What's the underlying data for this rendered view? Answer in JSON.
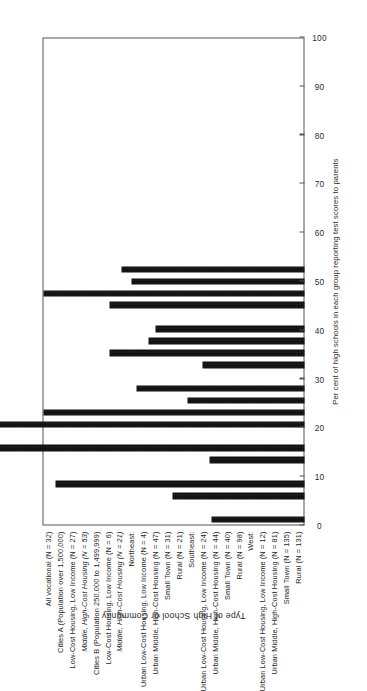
{
  "chart_data": {
    "type": "bar",
    "orientation": "horizontal",
    "title": "",
    "xlabel": "Per cent of high schools in each group reporting test scores to parents",
    "ylabel": "Type of High School or Community",
    "xlim": [
      0,
      100
    ],
    "xticks": [
      0,
      10,
      20,
      30,
      40,
      50,
      60,
      70,
      80,
      90,
      100
    ],
    "xtick_labels": [
      "0",
      "10",
      "20",
      "30",
      "40",
      "50",
      "60",
      "70",
      "80",
      "90",
      "100"
    ],
    "grid": false,
    "legend": null,
    "bar_color": "#111111",
    "categories": [
      "All vocational (N = 32)",
      "Cities A (Population over 1,500,000)",
      "Low-Cost Housing, Low Income (N = 27)",
      "Middle, High-Cost Housing (N = 53)",
      "Cities B (Population 250,000 to 1,499,999)",
      "Low-Cost Housing, Low Income (N = 6)",
      "Middle, High-Cost Housing (N = 21)",
      "Northeast:",
      "Urban Low-Cost Housing, Low Income (N = 4)",
      "Urban Middle, High-Cost Housing (N = 47)",
      "Small Town (N = 31)",
      "Rural (N = 21)",
      "Southeast:",
      "Urban Low-Cost Housing, Low Income (N = 24)",
      "Urban Middle, High-Cost Housing (N = 44)",
      "Small Town (N = 40)",
      "Rural (N = 98)",
      "West:",
      "Urban Low-Cost Housing, Low Income (N = 12)",
      "Urban Middle, High-Cost Housing (N = 81)",
      "Small Town (N = 135)",
      "Rural (N = 131)"
    ],
    "values": [
      19,
      null,
      27,
      51,
      null,
      19.5,
      74.5,
      null,
      74.5,
      53.5,
      24,
      34.5,
      null,
      21,
      40,
      32,
      30.5,
      null,
      40,
      53.5,
      35.5,
      37.5
    ],
    "bars": [
      {
        "label": "All vocational (N = 32)",
        "value": 19,
        "kind": "bar",
        "style": "plain"
      },
      {
        "label": "Cities A (Population over 1,500,000)",
        "value": null,
        "kind": "group-heading",
        "style": "plain"
      },
      {
        "label": "Low-Cost Housing, Low Income (N = 27)",
        "value": 27,
        "kind": "bar",
        "style": "plain"
      },
      {
        "label": "Middle, High-Cost Housing (N = 53)",
        "value": 51,
        "kind": "bar",
        "style": "italic"
      },
      {
        "label": "Cities B (Population 250,000 to 1,499,999)",
        "value": null,
        "kind": "group-heading",
        "style": "plain"
      },
      {
        "label": "Low-Cost Housing, Low Income (N = 6)",
        "value": 19.5,
        "kind": "bar",
        "style": "plain"
      },
      {
        "label": "Middle, High-Cost Housing (N = 21)",
        "value": 74.5,
        "kind": "bar",
        "style": "italic"
      },
      {
        "label": "Northeast:",
        "value": null,
        "kind": "group-heading",
        "style": "plain"
      },
      {
        "label": "Urban Low-Cost Housing, Low Income (N = 4)",
        "value": 74.5,
        "kind": "bar",
        "style": "plain"
      },
      {
        "label": "Urban Middle, High-Cost Housing (N = 47)",
        "value": 53.5,
        "kind": "bar",
        "style": "plain"
      },
      {
        "label": "Small Town (N = 31)",
        "value": 24,
        "kind": "bar",
        "style": "plain"
      },
      {
        "label": "Rural (N = 21)",
        "value": 34.5,
        "kind": "bar",
        "style": "plain"
      },
      {
        "label": "Southeast:",
        "value": null,
        "kind": "group-heading",
        "style": "plain"
      },
      {
        "label": "Urban Low-Cost Housing, Low Income (N = 24)",
        "value": 21,
        "kind": "bar",
        "style": "plain"
      },
      {
        "label": "Urban Middle, High-Cost Housing (N = 44)",
        "value": 40,
        "kind": "bar",
        "style": "plain"
      },
      {
        "label": "Small Town (N = 40)",
        "value": 32,
        "kind": "bar",
        "style": "plain"
      },
      {
        "label": "Rural (N = 98)",
        "value": 30.5,
        "kind": "bar",
        "style": "plain"
      },
      {
        "label": "West:",
        "value": null,
        "kind": "group-heading",
        "style": "plain"
      },
      {
        "label": "Urban Low-Cost Housing, Low Income (N = 12)",
        "value": 40,
        "kind": "bar",
        "style": "plain"
      },
      {
        "label": "Urban Middle, High-Cost Housing (N = 81)",
        "value": 53.5,
        "kind": "bar",
        "style": "plain"
      },
      {
        "label": "Small Town (N = 135)",
        "value": 35.5,
        "kind": "bar",
        "style": "plain"
      },
      {
        "label": "Rural (N = 131)",
        "value": 37.5,
        "kind": "bar",
        "style": "plain"
      }
    ]
  }
}
